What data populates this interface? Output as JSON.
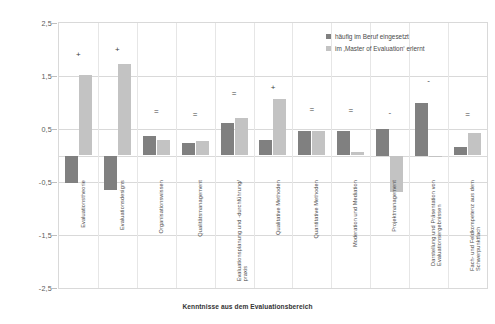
{
  "chart_data": {
    "type": "bar",
    "title": "",
    "xlabel": "Kenntnisse aus dem Evaluationsbereich",
    "ylabel": "",
    "ylim": [
      -2.5,
      2.5
    ],
    "yticks": [
      "2,5",
      "1,5",
      "0,5",
      "-0,5",
      "-1,5",
      "-2,5"
    ],
    "ytick_values": [
      2.5,
      1.5,
      0.5,
      -0.5,
      -1.5,
      -2.5
    ],
    "grid": true,
    "legend_position": "top-right",
    "categories": [
      "Evaluationstheorie",
      "Evaluationsdesigns",
      "Organisationswissen",
      "Qualitätsmanagement",
      "Evaluationsplanung und -durchführung/-praxis",
      "Qualitative Methoden",
      "Quantitative Methoden",
      "Moderation und Mediation",
      "Projektmanagement",
      "Darstellung und Präsentation von Evaluationsergebnissen",
      "Fach- und Feldkompetenz aus dem Schwerpunktfach"
    ],
    "series": [
      {
        "name": "häufig im Beruf eingesetzt",
        "color": "#808080",
        "values": [
          -0.52,
          -0.66,
          0.36,
          0.24,
          0.62,
          0.29,
          0.47,
          0.46,
          0.5,
          1.0,
          0.16
        ]
      },
      {
        "name": "im ‚Master of Evaluation‘ erlernt",
        "color": "#c3c3c3",
        "values": [
          1.52,
          1.72,
          0.3,
          0.28,
          0.7,
          1.06,
          0.47,
          0.06,
          -0.68,
          -0.02,
          0.42
        ]
      }
    ],
    "annotations": [
      {
        "category": "Evaluationstheorie",
        "marker": "+"
      },
      {
        "category": "Evaluationsdesigns",
        "marker": "+"
      },
      {
        "category": "Organisationswissen",
        "marker": "="
      },
      {
        "category": "Qualitätsmanagement",
        "marker": "="
      },
      {
        "category": "Evaluationsplanung und -durchführung/-praxis",
        "marker": "="
      },
      {
        "category": "Qualitative Methoden",
        "marker": "+"
      },
      {
        "category": "Quantitative Methoden",
        "marker": "="
      },
      {
        "category": "Moderation und Mediation",
        "marker": "="
      },
      {
        "category": "Projektmanagement",
        "marker": "-"
      },
      {
        "category": "Darstellung und Präsentation von Evaluationsergebnissen",
        "marker": "-"
      },
      {
        "category": "Fach- und Feldkompetenz aus dem Schwerpunktfach",
        "marker": "="
      }
    ],
    "annotation_y": [
      1.9,
      2.0,
      0.82,
      0.76,
      1.16,
      1.28,
      0.86,
      0.84,
      0.8,
      1.4,
      0.76
    ]
  },
  "legend": {
    "items": [
      {
        "label": "häufig im Beruf eingesetzt"
      },
      {
        "label": "im ‚Master of Evaluation‘ erlernt"
      }
    ]
  }
}
